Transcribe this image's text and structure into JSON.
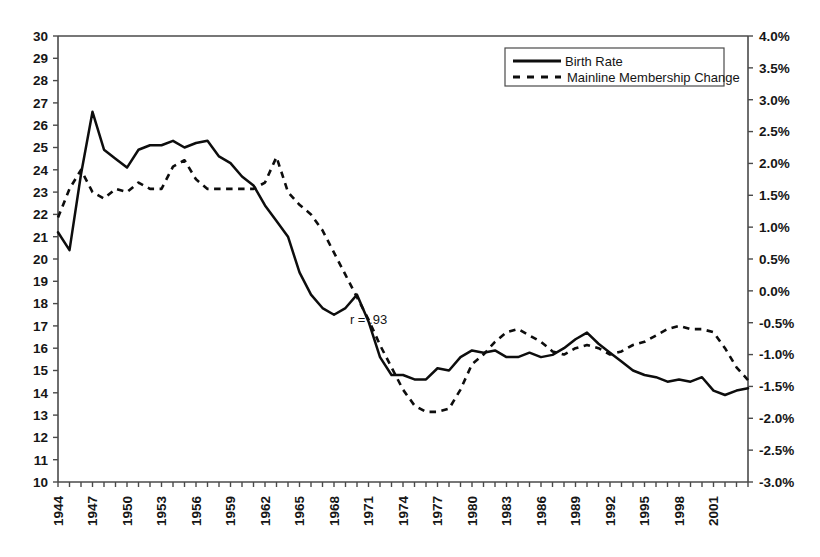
{
  "chart_data": {
    "type": "line",
    "title": "",
    "subtitle": "",
    "xlabel": "",
    "ylabel": "",
    "ylabel_right": "",
    "grid": false,
    "legend_position": "top-right",
    "xlim": [
      1944,
      2004
    ],
    "ylim": [
      10,
      30
    ],
    "ylim_right": [
      -3.0,
      4.0
    ],
    "x_tick_step": 1,
    "x_label_step": 3,
    "y_tick_step": 1,
    "y_right_tick_step": 0.5,
    "x": [
      1944,
      1945,
      1946,
      1947,
      1948,
      1949,
      1950,
      1951,
      1952,
      1953,
      1954,
      1955,
      1956,
      1957,
      1958,
      1959,
      1960,
      1961,
      1962,
      1963,
      1964,
      1965,
      1966,
      1967,
      1968,
      1969,
      1970,
      1971,
      1972,
      1973,
      1974,
      1975,
      1976,
      1977,
      1978,
      1979,
      1980,
      1981,
      1982,
      1983,
      1984,
      1985,
      1986,
      1987,
      1988,
      1989,
      1990,
      1991,
      1992,
      1993,
      1994,
      1995,
      1996,
      1997,
      1998,
      1999,
      2000,
      2001,
      2002,
      2003,
      2004
    ],
    "x_tick_labels": [
      "1944",
      "1947",
      "1950",
      "1953",
      "1956",
      "1959",
      "1962",
      "1965",
      "1968",
      "1971",
      "1974",
      "1977",
      "1980",
      "1983",
      "1986",
      "1989",
      "1992",
      "1995",
      "1998",
      "2001"
    ],
    "y_tick_labels": [
      "30",
      "29",
      "28",
      "27",
      "26",
      "25",
      "24",
      "23",
      "22",
      "21",
      "20",
      "19",
      "18",
      "17",
      "16",
      "15",
      "14",
      "13",
      "12",
      "11",
      "10"
    ],
    "y_right_tick_labels": [
      "4.0%",
      "3.5%",
      "3.0%",
      "2.5%",
      "2.0%",
      "1.5%",
      "1.0%",
      "0.5%",
      "0.0%",
      "-0.5%",
      "-1.0%",
      "-1.5%",
      "-2.0%",
      "-2.5%",
      "-3.0%"
    ],
    "series": [
      {
        "name": "Birth Rate",
        "style": "solid",
        "axis": "left",
        "units": "births per 1,000 population",
        "values": [
          21.2,
          20.4,
          23.8,
          26.6,
          24.9,
          24.5,
          24.1,
          24.9,
          25.1,
          25.1,
          25.3,
          25.0,
          25.2,
          25.3,
          24.6,
          24.3,
          23.7,
          23.3,
          22.4,
          21.7,
          21.0,
          19.4,
          18.4,
          17.8,
          17.5,
          17.8,
          18.4,
          17.2,
          15.6,
          14.8,
          14.8,
          14.6,
          14.6,
          15.1,
          15.0,
          15.6,
          15.9,
          15.8,
          15.9,
          15.6,
          15.6,
          15.8,
          15.6,
          15.7,
          16.0,
          16.4,
          16.7,
          16.2,
          15.8,
          15.4,
          15.0,
          14.8,
          14.7,
          14.5,
          14.6,
          14.5,
          14.7,
          14.1,
          13.9,
          14.1,
          14.2
        ]
      },
      {
        "name": "Mainline Membership Change",
        "style": "dashed",
        "axis": "right",
        "units": "percent change",
        "values": [
          1.15,
          1.6,
          1.9,
          1.55,
          1.45,
          1.6,
          1.55,
          1.7,
          1.6,
          1.6,
          1.95,
          2.05,
          1.75,
          1.6,
          1.6,
          1.6,
          1.6,
          1.6,
          1.7,
          2.1,
          1.55,
          1.35,
          1.2,
          0.95,
          0.6,
          0.25,
          -0.1,
          -0.45,
          -0.85,
          -1.2,
          -1.55,
          -1.8,
          -1.9,
          -1.9,
          -1.85,
          -1.55,
          -1.15,
          -1.0,
          -0.8,
          -0.65,
          -0.6,
          -0.7,
          -0.8,
          -0.95,
          -1.0,
          -0.9,
          -0.85,
          -0.9,
          -1.0,
          -0.95,
          -0.85,
          -0.8,
          -0.7,
          -0.6,
          -0.55,
          -0.6,
          -0.6,
          -0.65,
          -0.9,
          -1.2,
          -1.4
        ]
      }
    ],
    "annotations": [
      {
        "text": "r = .93",
        "x": 1971,
        "y": 17.1
      }
    ]
  },
  "legend": {
    "items": [
      {
        "label": "Birth Rate",
        "style": "solid"
      },
      {
        "label": "Mainline Membership Change",
        "style": "dashed"
      }
    ]
  },
  "colors": {
    "series": "#0d0d0d",
    "axis": "#4a4a4a",
    "text": "#161616",
    "background": "#ffffff"
  }
}
